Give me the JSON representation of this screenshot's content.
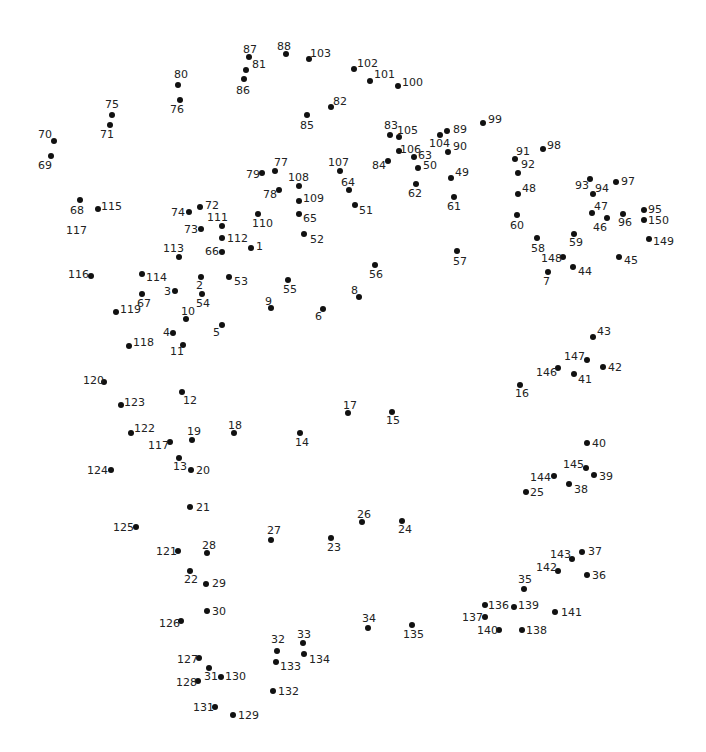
{
  "colors": {
    "dot": "#111111",
    "label": "#222222",
    "background": "#ffffff"
  },
  "points": [
    {
      "n": "1",
      "x": 251,
      "y": 248,
      "lx": 256,
      "ly": 241
    },
    {
      "n": "2",
      "x": 201,
      "y": 277,
      "lx": 196,
      "ly": 280
    },
    {
      "n": "3",
      "x": 175,
      "y": 291,
      "lx": 164,
      "ly": 286
    },
    {
      "n": "4",
      "x": 173,
      "y": 333,
      "lx": 163,
      "ly": 327
    },
    {
      "n": "5",
      "x": 222,
      "y": 325,
      "lx": 213,
      "ly": 327
    },
    {
      "n": "6",
      "x": 323,
      "y": 309,
      "lx": 315,
      "ly": 311
    },
    {
      "n": "7",
      "x": 548,
      "y": 272,
      "lx": 543,
      "ly": 276
    },
    {
      "n": "8",
      "x": 359,
      "y": 297,
      "lx": 351,
      "ly": 285
    },
    {
      "n": "9",
      "x": 271,
      "y": 308,
      "lx": 265,
      "ly": 296
    },
    {
      "n": "10",
      "x": 186,
      "y": 319,
      "lx": 181,
      "ly": 306
    },
    {
      "n": "11",
      "x": 183,
      "y": 345,
      "lx": 170,
      "ly": 346
    },
    {
      "n": "12",
      "x": 182,
      "y": 392,
      "lx": 183,
      "ly": 395
    },
    {
      "n": "13",
      "x": 179,
      "y": 458,
      "lx": 173,
      "ly": 461
    },
    {
      "n": "14",
      "x": 300,
      "y": 433,
      "lx": 295,
      "ly": 437
    },
    {
      "n": "15",
      "x": 392,
      "y": 412,
      "lx": 386,
      "ly": 415
    },
    {
      "n": "16",
      "x": 520,
      "y": 385,
      "lx": 515,
      "ly": 388
    },
    {
      "n": "17",
      "x": 348,
      "y": 413,
      "lx": 343,
      "ly": 400
    },
    {
      "n": "18",
      "x": 234,
      "y": 433,
      "lx": 228,
      "ly": 420
    },
    {
      "n": "19",
      "x": 192,
      "y": 440,
      "lx": 187,
      "ly": 426
    },
    {
      "n": "20",
      "x": 191,
      "y": 470,
      "lx": 196,
      "ly": 465
    },
    {
      "n": "21",
      "x": 190,
      "y": 507,
      "lx": 196,
      "ly": 502
    },
    {
      "n": "22",
      "x": 190,
      "y": 571,
      "lx": 184,
      "ly": 574
    },
    {
      "n": "23",
      "x": 331,
      "y": 538,
      "lx": 327,
      "ly": 542
    },
    {
      "n": "24",
      "x": 402,
      "y": 521,
      "lx": 398,
      "ly": 524
    },
    {
      "n": "25",
      "x": 526,
      "y": 492,
      "lx": 530,
      "ly": 487
    },
    {
      "n": "26",
      "x": 362,
      "y": 522,
      "lx": 357,
      "ly": 509
    },
    {
      "n": "27",
      "x": 271,
      "y": 540,
      "lx": 267,
      "ly": 525
    },
    {
      "n": "28",
      "x": 207,
      "y": 553,
      "lx": 202,
      "ly": 540
    },
    {
      "n": "29",
      "x": 206,
      "y": 584,
      "lx": 212,
      "ly": 578
    },
    {
      "n": "30",
      "x": 207,
      "y": 611,
      "lx": 212,
      "ly": 606
    },
    {
      "n": "31",
      "x": 209,
      "y": 668,
      "lx": 204,
      "ly": 671
    },
    {
      "n": "32",
      "x": 277,
      "y": 651,
      "lx": 271,
      "ly": 634
    },
    {
      "n": "33",
      "x": 303,
      "y": 643,
      "lx": 297,
      "ly": 629
    },
    {
      "n": "34",
      "x": 368,
      "y": 628,
      "lx": 362,
      "ly": 613
    },
    {
      "n": "35",
      "x": 524,
      "y": 589,
      "lx": 518,
      "ly": 574
    },
    {
      "n": "36",
      "x": 587,
      "y": 575,
      "lx": 592,
      "ly": 570
    },
    {
      "n": "37",
      "x": 582,
      "y": 552,
      "lx": 588,
      "ly": 546
    },
    {
      "n": "38",
      "x": 569,
      "y": 484,
      "lx": 574,
      "ly": 484
    },
    {
      "n": "39",
      "x": 594,
      "y": 475,
      "lx": 599,
      "ly": 471
    },
    {
      "n": "40",
      "x": 587,
      "y": 443,
      "lx": 592,
      "ly": 438
    },
    {
      "n": "41",
      "x": 574,
      "y": 374,
      "lx": 578,
      "ly": 374
    },
    {
      "n": "42",
      "x": 603,
      "y": 367,
      "lx": 608,
      "ly": 362
    },
    {
      "n": "43",
      "x": 593,
      "y": 337,
      "lx": 597,
      "ly": 326
    },
    {
      "n": "44",
      "x": 573,
      "y": 267,
      "lx": 578,
      "ly": 266
    },
    {
      "n": "45",
      "x": 619,
      "y": 257,
      "lx": 624,
      "ly": 255
    },
    {
      "n": "46",
      "x": 607,
      "y": 218,
      "lx": 593,
      "ly": 222
    },
    {
      "n": "47",
      "x": 592,
      "y": 213,
      "lx": 594,
      "ly": 201
    },
    {
      "n": "48",
      "x": 518,
      "y": 194,
      "lx": 522,
      "ly": 183
    },
    {
      "n": "49",
      "x": 451,
      "y": 178,
      "lx": 455,
      "ly": 167
    },
    {
      "n": "50",
      "x": 418,
      "y": 168,
      "lx": 423,
      "ly": 160
    },
    {
      "n": "51",
      "x": 355,
      "y": 205,
      "lx": 359,
      "ly": 205
    },
    {
      "n": "52",
      "x": 304,
      "y": 234,
      "lx": 310,
      "ly": 234
    },
    {
      "n": "53",
      "x": 229,
      "y": 277,
      "lx": 234,
      "ly": 276
    },
    {
      "n": "54",
      "x": 202,
      "y": 294,
      "lx": 196,
      "ly": 298
    },
    {
      "n": "55",
      "x": 288,
      "y": 280,
      "lx": 283,
      "ly": 284
    },
    {
      "n": "56",
      "x": 375,
      "y": 265,
      "lx": 369,
      "ly": 269
    },
    {
      "n": "57",
      "x": 457,
      "y": 251,
      "lx": 453,
      "ly": 256
    },
    {
      "n": "58",
      "x": 537,
      "y": 238,
      "lx": 531,
      "ly": 243
    },
    {
      "n": "59",
      "x": 574,
      "y": 234,
      "lx": 569,
      "ly": 237
    },
    {
      "n": "60",
      "x": 517,
      "y": 215,
      "lx": 510,
      "ly": 220
    },
    {
      "n": "61",
      "x": 454,
      "y": 197,
      "lx": 447,
      "ly": 201
    },
    {
      "n": "62",
      "x": 416,
      "y": 184,
      "lx": 408,
      "ly": 188
    },
    {
      "n": "63",
      "x": 414,
      "y": 157,
      "lx": 418,
      "ly": 150
    },
    {
      "n": "64",
      "x": 349,
      "y": 190,
      "lx": 341,
      "ly": 177
    },
    {
      "n": "65",
      "x": 299,
      "y": 214,
      "lx": 303,
      "ly": 213
    },
    {
      "n": "66",
      "x": 222,
      "y": 252,
      "lx": 205,
      "ly": 246
    },
    {
      "n": "67",
      "x": 142,
      "y": 294,
      "lx": 137,
      "ly": 298
    },
    {
      "n": "68",
      "x": 80,
      "y": 200,
      "lx": 70,
      "ly": 205
    },
    {
      "n": "69",
      "x": 51,
      "y": 156,
      "lx": 38,
      "ly": 160
    },
    {
      "n": "70",
      "x": 54,
      "y": 141,
      "lx": 38,
      "ly": 129
    },
    {
      "n": "71",
      "x": 110,
      "y": 125,
      "lx": 100,
      "ly": 129
    },
    {
      "n": "72",
      "x": 200,
      "y": 207,
      "lx": 205,
      "ly": 200
    },
    {
      "n": "73",
      "x": 201,
      "y": 229,
      "lx": 184,
      "ly": 224
    },
    {
      "n": "74",
      "x": 189,
      "y": 212,
      "lx": 171,
      "ly": 207
    },
    {
      "n": "75",
      "x": 112,
      "y": 115,
      "lx": 105,
      "ly": 99
    },
    {
      "n": "76",
      "x": 180,
      "y": 100,
      "lx": 170,
      "ly": 104
    },
    {
      "n": "77",
      "x": 275,
      "y": 171,
      "lx": 274,
      "ly": 157
    },
    {
      "n": "78",
      "x": 279,
      "y": 190,
      "lx": 263,
      "ly": 189
    },
    {
      "n": "79",
      "x": 262,
      "y": 173,
      "lx": 246,
      "ly": 169
    },
    {
      "n": "80",
      "x": 178,
      "y": 85,
      "lx": 174,
      "ly": 69
    },
    {
      "n": "81",
      "x": 246,
      "y": 70,
      "lx": 252,
      "ly": 59
    },
    {
      "n": "82",
      "x": 331,
      "y": 107,
      "lx": 333,
      "ly": 96
    },
    {
      "n": "83",
      "x": 390,
      "y": 135,
      "lx": 384,
      "ly": 120
    },
    {
      "n": "84",
      "x": 388,
      "y": 161,
      "lx": 372,
      "ly": 160
    },
    {
      "n": "85",
      "x": 307,
      "y": 115,
      "lx": 300,
      "ly": 120
    },
    {
      "n": "86",
      "x": 244,
      "y": 79,
      "lx": 236,
      "ly": 85
    },
    {
      "n": "87",
      "x": 249,
      "y": 57,
      "lx": 243,
      "ly": 44
    },
    {
      "n": "88",
      "x": 286,
      "y": 54,
      "lx": 277,
      "ly": 41
    },
    {
      "n": "89",
      "x": 447,
      "y": 131,
      "lx": 453,
      "ly": 124
    },
    {
      "n": "90",
      "x": 448,
      "y": 152,
      "lx": 453,
      "ly": 141
    },
    {
      "n": "91",
      "x": 515,
      "y": 159,
      "lx": 516,
      "ly": 146
    },
    {
      "n": "92",
      "x": 518,
      "y": 173,
      "lx": 521,
      "ly": 159
    },
    {
      "n": "93",
      "x": 590,
      "y": 179,
      "lx": 575,
      "ly": 180
    },
    {
      "n": "94",
      "x": 593,
      "y": 194,
      "lx": 595,
      "ly": 183
    },
    {
      "n": "95",
      "x": 644,
      "y": 210,
      "lx": 648,
      "ly": 204
    },
    {
      "n": "96",
      "x": 623,
      "y": 214,
      "lx": 618,
      "ly": 217
    },
    {
      "n": "97",
      "x": 616,
      "y": 182,
      "lx": 621,
      "ly": 176
    },
    {
      "n": "98",
      "x": 543,
      "y": 149,
      "lx": 547,
      "ly": 140
    },
    {
      "n": "99",
      "x": 483,
      "y": 123,
      "lx": 488,
      "ly": 114
    },
    {
      "n": "100",
      "x": 398,
      "y": 86,
      "lx": 402,
      "ly": 77
    },
    {
      "n": "101",
      "x": 370,
      "y": 81,
      "lx": 374,
      "ly": 69
    },
    {
      "n": "102",
      "x": 354,
      "y": 69,
      "lx": 357,
      "ly": 58
    },
    {
      "n": "103",
      "x": 309,
      "y": 59,
      "lx": 310,
      "ly": 48
    },
    {
      "n": "104",
      "x": 440,
      "y": 135,
      "lx": 429,
      "ly": 138
    },
    {
      "n": "105",
      "x": 399,
      "y": 137,
      "lx": 397,
      "ly": 125
    },
    {
      "n": "106",
      "x": 399,
      "y": 151,
      "lx": 400,
      "ly": 144
    },
    {
      "n": "107",
      "x": 340,
      "y": 171,
      "lx": 328,
      "ly": 157
    },
    {
      "n": "108",
      "x": 299,
      "y": 186,
      "lx": 288,
      "ly": 172
    },
    {
      "n": "109",
      "x": 299,
      "y": 201,
      "lx": 303,
      "ly": 193
    },
    {
      "n": "110",
      "x": 258,
      "y": 214,
      "lx": 252,
      "ly": 218
    },
    {
      "n": "111",
      "x": 222,
      "y": 226,
      "lx": 207,
      "ly": 212
    },
    {
      "n": "112",
      "x": 222,
      "y": 238,
      "lx": 227,
      "ly": 233
    },
    {
      "n": "113",
      "x": 179,
      "y": 257,
      "lx": 163,
      "ly": 243
    },
    {
      "n": "114",
      "x": 142,
      "y": 274,
      "lx": 146,
      "ly": 272
    },
    {
      "n": "115",
      "x": 98,
      "y": 209,
      "lx": 101,
      "ly": 201
    },
    {
      "n": "116",
      "x": 91,
      "y": 276,
      "lx": 68,
      "ly": 269
    },
    {
      "n": "117",
      "x": 170,
      "y": 442,
      "lx": 148,
      "ly": 440
    },
    {
      "n": "117b",
      "x": null,
      "y": null,
      "lx": 66,
      "ly": 225,
      "text": "117"
    },
    {
      "n": "118",
      "x": 129,
      "y": 346,
      "lx": 133,
      "ly": 337
    },
    {
      "n": "119",
      "x": 116,
      "y": 312,
      "lx": 120,
      "ly": 304
    },
    {
      "n": "120",
      "x": 104,
      "y": 382,
      "lx": 83,
      "ly": 375
    },
    {
      "n": "121",
      "x": 178,
      "y": 551,
      "lx": 156,
      "ly": 546
    },
    {
      "n": "122",
      "x": 131,
      "y": 433,
      "lx": 134,
      "ly": 423
    },
    {
      "n": "123",
      "x": 121,
      "y": 405,
      "lx": 124,
      "ly": 397
    },
    {
      "n": "124",
      "x": 111,
      "y": 470,
      "lx": 87,
      "ly": 465
    },
    {
      "n": "125",
      "x": 136,
      "y": 527,
      "lx": 113,
      "ly": 522
    },
    {
      "n": "126",
      "x": 181,
      "y": 621,
      "lx": 159,
      "ly": 618
    },
    {
      "n": "127",
      "x": 199,
      "y": 658,
      "lx": 177,
      "ly": 654
    },
    {
      "n": "128",
      "x": 198,
      "y": 681,
      "lx": 176,
      "ly": 677
    },
    {
      "n": "129",
      "x": 233,
      "y": 715,
      "lx": 238,
      "ly": 710
    },
    {
      "n": "130",
      "x": 221,
      "y": 677,
      "lx": 225,
      "ly": 671
    },
    {
      "n": "131",
      "x": 215,
      "y": 707,
      "lx": 193,
      "ly": 702
    },
    {
      "n": "132",
      "x": 273,
      "y": 691,
      "lx": 278,
      "ly": 686
    },
    {
      "n": "133",
      "x": 276,
      "y": 662,
      "lx": 280,
      "ly": 661
    },
    {
      "n": "134",
      "x": 304,
      "y": 654,
      "lx": 309,
      "ly": 654
    },
    {
      "n": "135",
      "x": 412,
      "y": 625,
      "lx": 403,
      "ly": 629
    },
    {
      "n": "136",
      "x": 485,
      "y": 605,
      "lx": 488,
      "ly": 600
    },
    {
      "n": "137",
      "x": 485,
      "y": 617,
      "lx": 462,
      "ly": 612
    },
    {
      "n": "138",
      "x": 522,
      "y": 630,
      "lx": 526,
      "ly": 625
    },
    {
      "n": "139",
      "x": 514,
      "y": 607,
      "lx": 518,
      "ly": 600
    },
    {
      "n": "140",
      "x": 499,
      "y": 630,
      "lx": 477,
      "ly": 625
    },
    {
      "n": "141",
      "x": 555,
      "y": 612,
      "lx": 561,
      "ly": 607
    },
    {
      "n": "142",
      "x": 558,
      "y": 571,
      "lx": 536,
      "ly": 562
    },
    {
      "n": "143",
      "x": 572,
      "y": 559,
      "lx": 550,
      "ly": 549
    },
    {
      "n": "144",
      "x": 554,
      "y": 476,
      "lx": 530,
      "ly": 472
    },
    {
      "n": "145",
      "x": 586,
      "y": 468,
      "lx": 563,
      "ly": 459
    },
    {
      "n": "146",
      "x": 558,
      "y": 368,
      "lx": 536,
      "ly": 367
    },
    {
      "n": "147",
      "x": 587,
      "y": 360,
      "lx": 564,
      "ly": 351
    },
    {
      "n": "148",
      "x": 563,
      "y": 257,
      "lx": 541,
      "ly": 253
    },
    {
      "n": "149",
      "x": 649,
      "y": 239,
      "lx": 653,
      "ly": 236
    },
    {
      "n": "150",
      "x": 644,
      "y": 220,
      "lx": 648,
      "ly": 215
    }
  ]
}
